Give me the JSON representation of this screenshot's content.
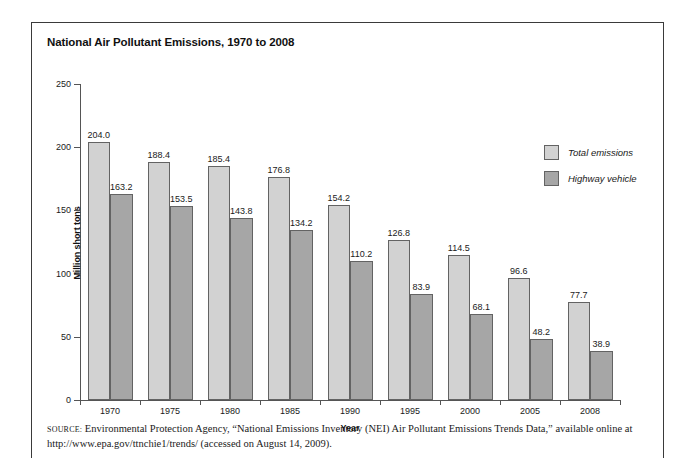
{
  "figure": {
    "title": "National Air Pollutant Emissions, 1970 to 2008",
    "source_label": "SOURCE:",
    "source_text": " Environmental Protection Agency, “National Emissions Inventory (NEI) Air Pollutant Emissions Trends Data,” available online at http://www.epa.gov/ttnchie1/trends/ (accessed on August 14, 2009)."
  },
  "legend": {
    "position": "top-right",
    "items": [
      {
        "label": "Total emissions",
        "color": "#d2d2d2"
      },
      {
        "label": "Highway vehicle",
        "color": "#a6a6a6"
      }
    ]
  },
  "chart_data": {
    "type": "bar",
    "title": "National Air Pollutant Emissions, 1970 to 2008",
    "xlabel": "Year",
    "ylabel": "Million short tons",
    "categories": [
      "1970",
      "1975",
      "1980",
      "1985",
      "1990",
      "1995",
      "2000",
      "2005",
      "2008"
    ],
    "series": [
      {
        "name": "Total emissions",
        "color": "#d2d2d2",
        "values": [
          204.0,
          188.4,
          185.4,
          176.8,
          154.2,
          126.8,
          114.5,
          96.6,
          77.7
        ],
        "labels": [
          "204.0",
          "188.4",
          "185.4",
          "176.8",
          "154.2",
          "126.8",
          "114.5",
          "96.6",
          "77.7"
        ]
      },
      {
        "name": "Highway vehicle",
        "color": "#a6a6a6",
        "values": [
          163.2,
          153.5,
          143.8,
          134.2,
          110.2,
          83.9,
          68.1,
          48.2,
          38.9
        ],
        "labels": [
          "163.2",
          "153.5",
          "143.8",
          "134.2",
          "110.2",
          "83.9",
          "68.1",
          "48.2",
          "38.9"
        ]
      }
    ],
    "ylim": [
      0,
      250
    ],
    "yticks": [
      0,
      50,
      100,
      150,
      200,
      250
    ],
    "ytick_labels": [
      "0",
      "50",
      "100",
      "150",
      "200",
      "250"
    ],
    "grid": false,
    "legend_position": "top-right"
  }
}
